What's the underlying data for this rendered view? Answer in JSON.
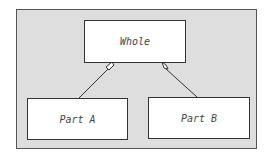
{
  "diagram": {
    "type": "UML aggregation",
    "whole": {
      "label": "Whole"
    },
    "parts": [
      {
        "label": "Part A"
      },
      {
        "label": "Part B"
      }
    ],
    "relationship": "aggregation (hollow diamond at Whole)",
    "colors": {
      "background": "#dedede",
      "box_fill": "#ffffff",
      "stroke": "#333333"
    }
  }
}
